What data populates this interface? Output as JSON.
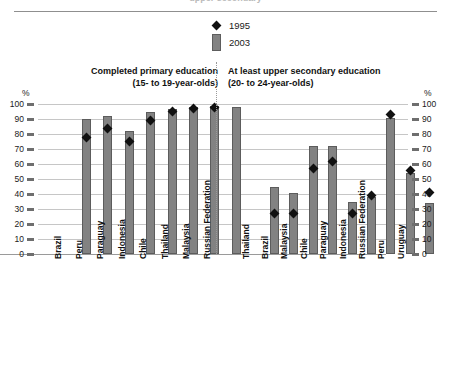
{
  "top_partial_title": "upper secondary",
  "axis_symbol": "%",
  "legend": [
    {
      "label": "1995",
      "marker": "diamond",
      "color": "#111111"
    },
    {
      "label": "2003",
      "marker": "bar",
      "color": "#828282"
    }
  ],
  "sections": [
    {
      "title_line1": "Completed primary education",
      "title_line2": "(15- to 19-year-olds)"
    },
    {
      "title_line1": "At least upper secondary education",
      "title_line2": "(20- to 24-year-olds)"
    }
  ],
  "y_ticks": [
    "0",
    "10",
    "20",
    "30",
    "40",
    "50",
    "60",
    "70",
    "80",
    "90",
    "100"
  ],
  "chart_data": {
    "type": "bar",
    "title": "",
    "xlabel": "",
    "ylabel": "%",
    "ylim": [
      0,
      100
    ],
    "grid": true,
    "legend_position": "top-center",
    "panels": [
      {
        "name": "Completed primary education (15- to 19-year-olds)",
        "categories": [
          "Brazil",
          "Peru",
          "Paraguay",
          "Indonesia",
          "Chile",
          "Thailand",
          "Malaysia",
          "Russian Federation"
        ],
        "series": [
          {
            "name": "2003",
            "type": "bar",
            "values": [
              90,
              92,
              82,
              95,
              97,
              98,
              99,
              98
            ]
          },
          {
            "name": "1995",
            "type": "marker",
            "values": [
              78,
              84,
              75,
              89,
              95,
              97,
              98,
              null
            ]
          }
        ]
      },
      {
        "name": "At least upper secondary education (20- to 24-year-olds)",
        "categories": [
          "Thailand",
          "Brazil",
          "Malaysia",
          "Chile",
          "Paraguay",
          "Indonesia",
          "Russian Federation",
          "Peru",
          "Uruguay"
        ],
        "series": [
          {
            "name": "2003",
            "type": "bar",
            "values": [
              45,
              41,
              72,
              72,
              35,
              38,
              91,
              54,
              34
            ]
          },
          {
            "name": "1995",
            "type": "marker",
            "values": [
              27,
              27,
              57,
              62,
              27,
              39,
              93,
              56,
              41
            ]
          }
        ]
      }
    ]
  }
}
